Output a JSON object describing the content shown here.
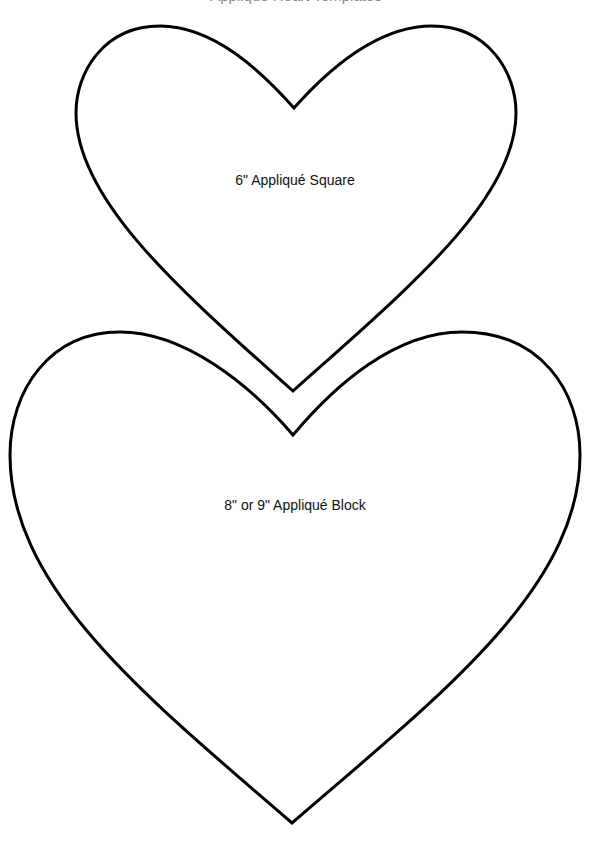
{
  "page": {
    "title": "Appliqué Heart Templates",
    "stroke_color": "#000000",
    "background": "#ffffff"
  },
  "shapes": [
    {
      "name": "small-heart",
      "label": "6\" Appliqué Square"
    },
    {
      "name": "large-heart",
      "label": "8\" or 9\" Appliqué Block"
    }
  ]
}
